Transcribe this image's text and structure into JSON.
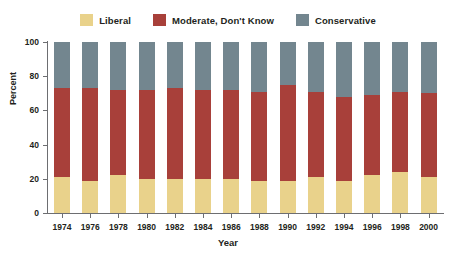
{
  "chart_data": {
    "type": "bar",
    "stacked": true,
    "title": "",
    "xlabel": "Year",
    "ylabel": "Percent",
    "ylim": [
      0,
      100
    ],
    "yticks": [
      0,
      20,
      40,
      60,
      80,
      100
    ],
    "grid": false,
    "legend_position": "top",
    "categories": [
      "1974",
      "1976",
      "1978",
      "1980",
      "1982",
      "1984",
      "1986",
      "1988",
      "1990",
      "1992",
      "1994",
      "1996",
      "1998",
      "2000"
    ],
    "series": [
      {
        "name": "Liberal",
        "color": "#e9d28b",
        "values": [
          21,
          19,
          22,
          20,
          20,
          20,
          20,
          19,
          19,
          21,
          19,
          22,
          24,
          21
        ]
      },
      {
        "name": "Moderate, Don't Know",
        "color": "#a8403a",
        "values": [
          52,
          54,
          50,
          52,
          53,
          52,
          52,
          52,
          56,
          50,
          49,
          47,
          47,
          49
        ]
      },
      {
        "name": "Conservative",
        "color": "#73868f",
        "values": [
          27,
          27,
          28,
          28,
          27,
          28,
          28,
          29,
          25,
          29,
          32,
          31,
          29,
          30
        ]
      }
    ]
  },
  "legend": {
    "items": [
      {
        "label": "Liberal"
      },
      {
        "label": "Moderate, Don't Know"
      },
      {
        "label": "Conservative"
      }
    ]
  },
  "axes": {
    "y_title": "Percent",
    "x_title": "Year",
    "y_tick_labels": [
      "0",
      "20",
      "40",
      "60",
      "80",
      "100"
    ],
    "x_tick_labels": [
      "1974",
      "1976",
      "1978",
      "1980",
      "1982",
      "1984",
      "1986",
      "1988",
      "1990",
      "1992",
      "1994",
      "1996",
      "1998",
      "2000"
    ]
  }
}
